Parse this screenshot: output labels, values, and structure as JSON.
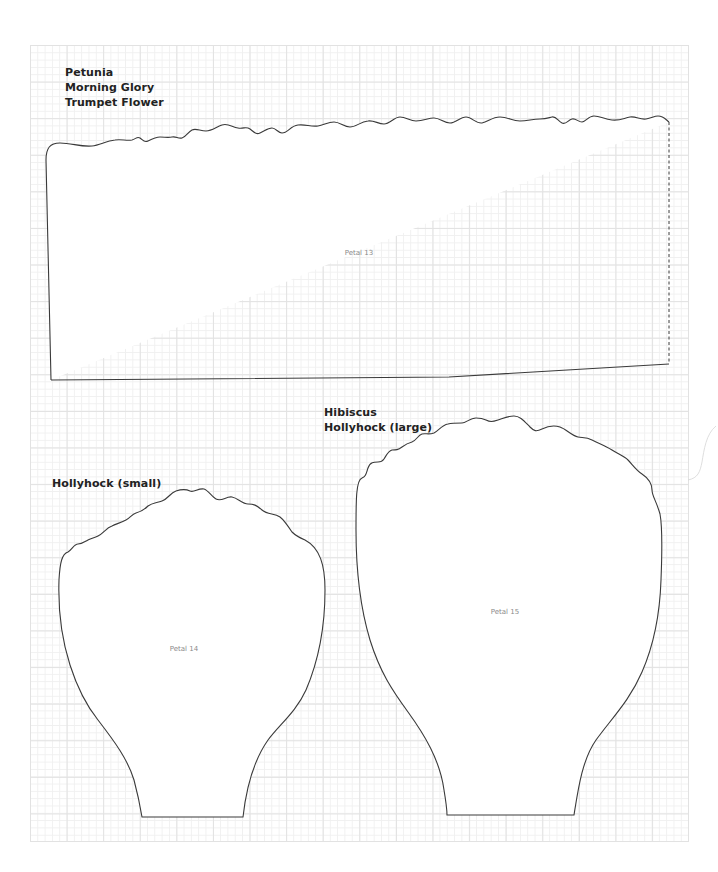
{
  "page": {
    "background": "#ffffff",
    "grid": {
      "major_color": "#e2e2e2",
      "minor_color": "#f0f0f0"
    },
    "outline_color": "#3a3a3a"
  },
  "groups": [
    {
      "id": "group-1",
      "labels": [
        "Petunia",
        "Morning Glory",
        "Trumpet Flower"
      ]
    },
    {
      "id": "group-2",
      "labels": [
        "Hibiscus",
        "Hollyhock (large)"
      ]
    },
    {
      "id": "group-3",
      "labels": [
        "Hollyhock (small)"
      ]
    }
  ],
  "petals": [
    {
      "id": "petal-13",
      "name": "Petal 13"
    },
    {
      "id": "petal-14",
      "name": "Petal 14"
    },
    {
      "id": "petal-15",
      "name": "Petal 15"
    }
  ]
}
